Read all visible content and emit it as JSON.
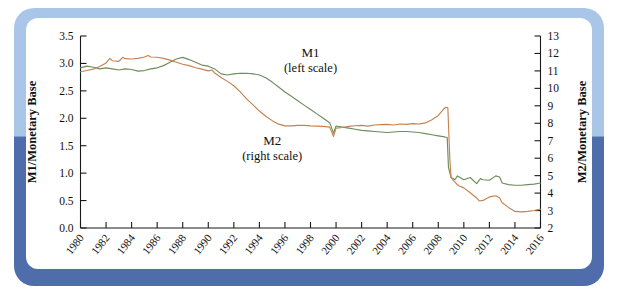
{
  "figure": {
    "frame_top_color": "#a9c6e8",
    "frame_bottom_color": "#4f6cab",
    "background_color": "#ffffff"
  },
  "chart_data": {
    "type": "line",
    "title": "",
    "xlabel": "",
    "ylabel": "M1/Monetary Base",
    "y2label": "M2/Monetary Base",
    "grid": false,
    "legend": "in-plot annotations",
    "xlim": [
      1980,
      2016
    ],
    "ylim": [
      0.0,
      3.5
    ],
    "y2lim": [
      2,
      13
    ],
    "xticks": [
      1980,
      1982,
      1984,
      1986,
      1988,
      1990,
      1992,
      1994,
      1996,
      1998,
      2000,
      2002,
      2004,
      2006,
      2008,
      2010,
      2012,
      2014,
      2016
    ],
    "xtick_labels": [
      "1980",
      "1982",
      "1984",
      "1986",
      "1988",
      "1990",
      "1992",
      "1994",
      "1996",
      "1998",
      "2000",
      "2002",
      "2004",
      "2006",
      "2008",
      "2010",
      "2012",
      "2014",
      "2016"
    ],
    "yticks": [
      0.0,
      0.5,
      1.0,
      1.5,
      2.0,
      2.5,
      3.0,
      3.5
    ],
    "ytick_labels": [
      "0.0",
      "0.5",
      "1.0",
      "1.5",
      "2.0",
      "2.5",
      "3.0",
      "3.5"
    ],
    "y2ticks": [
      2,
      3,
      4,
      5,
      6,
      7,
      8,
      9,
      10,
      11,
      12,
      13
    ],
    "y2tick_labels": [
      "2",
      "3",
      "4",
      "5",
      "6",
      "7",
      "8",
      "9",
      "10",
      "11",
      "12",
      "13"
    ],
    "annotations": [
      {
        "name": "m1-label",
        "line1": "M1",
        "line2": "(left scale)",
        "x": 1998.0,
        "y": 3.12
      },
      {
        "name": "m2-label",
        "line1": "M2",
        "line2": "(right scale)",
        "x": 1995.0,
        "y": 1.52
      }
    ],
    "series": [
      {
        "name": "M1",
        "axis": "left",
        "color": "#6e8d5d",
        "x": [
          1980.0,
          1980.5,
          1981.0,
          1981.5,
          1982.0,
          1982.5,
          1983.0,
          1983.5,
          1984.0,
          1984.5,
          1985.0,
          1985.5,
          1986.0,
          1986.5,
          1987.0,
          1987.5,
          1988.0,
          1988.5,
          1989.0,
          1989.5,
          1990.0,
          1990.5,
          1991.0,
          1991.5,
          1992.0,
          1992.5,
          1993.0,
          1993.5,
          1994.0,
          1994.5,
          1995.0,
          1995.5,
          1996.0,
          1996.5,
          1997.0,
          1997.5,
          1998.0,
          1998.5,
          1999.0,
          1999.5,
          1999.8,
          2000.0,
          2000.5,
          2001.0,
          2001.5,
          2002.0,
          2002.5,
          2003.0,
          2003.5,
          2004.0,
          2004.5,
          2005.0,
          2005.5,
          2006.0,
          2006.5,
          2007.0,
          2007.5,
          2008.0,
          2008.5,
          2008.7,
          2008.8,
          2009.0,
          2009.3,
          2009.5,
          2010.0,
          2010.5,
          2011.0,
          2011.3,
          2011.5,
          2012.0,
          2012.5,
          2012.8,
          2013.0,
          2013.5,
          2014.0,
          2014.5,
          2015.0,
          2015.5,
          2016.0
        ],
        "y": [
          2.92,
          2.95,
          2.93,
          2.9,
          2.92,
          2.9,
          2.88,
          2.9,
          2.89,
          2.86,
          2.87,
          2.9,
          2.92,
          2.96,
          3.02,
          3.08,
          3.11,
          3.07,
          3.02,
          2.97,
          2.95,
          2.9,
          2.81,
          2.79,
          2.81,
          2.82,
          2.82,
          2.81,
          2.79,
          2.74,
          2.66,
          2.57,
          2.48,
          2.4,
          2.32,
          2.24,
          2.16,
          2.08,
          2.0,
          1.92,
          1.73,
          1.86,
          1.84,
          1.82,
          1.8,
          1.78,
          1.77,
          1.76,
          1.75,
          1.74,
          1.75,
          1.76,
          1.76,
          1.75,
          1.74,
          1.72,
          1.7,
          1.68,
          1.66,
          1.65,
          1.1,
          0.92,
          0.88,
          0.95,
          0.88,
          0.92,
          0.81,
          0.9,
          0.88,
          0.87,
          0.95,
          0.93,
          0.82,
          0.79,
          0.78,
          0.78,
          0.79,
          0.8,
          0.82
        ]
      },
      {
        "name": "M2",
        "axis": "right",
        "color": "#c5824f",
        "x": [
          1980.0,
          1980.5,
          1981.0,
          1981.5,
          1982.0,
          1982.3,
          1982.5,
          1983.0,
          1983.3,
          1983.5,
          1984.0,
          1984.5,
          1985.0,
          1985.3,
          1985.5,
          1986.0,
          1986.5,
          1987.0,
          1987.5,
          1988.0,
          1988.5,
          1989.0,
          1989.5,
          1990.0,
          1990.3,
          1990.5,
          1991.0,
          1991.5,
          1992.0,
          1992.5,
          1993.0,
          1993.5,
          1994.0,
          1994.5,
          1995.0,
          1995.5,
          1996.0,
          1996.5,
          1997.0,
          1997.5,
          1998.0,
          1998.5,
          1999.0,
          1999.5,
          1999.8,
          2000.0,
          2000.5,
          2001.0,
          2001.5,
          2002.0,
          2002.5,
          2003.0,
          2003.5,
          2004.0,
          2004.5,
          2005.0,
          2005.5,
          2006.0,
          2006.5,
          2007.0,
          2007.5,
          2008.0,
          2008.4,
          2008.6,
          2008.75,
          2008.9,
          2009.0,
          2009.2,
          2009.4,
          2009.6,
          2010.0,
          2010.5,
          2011.0,
          2011.2,
          2011.5,
          2012.0,
          2012.5,
          2012.8,
          2013.0,
          2013.5,
          2014.0,
          2014.5,
          2015.0,
          2015.5,
          2016.0
        ],
        "y": [
          10.95,
          11.02,
          11.1,
          11.25,
          11.45,
          11.72,
          11.58,
          11.55,
          11.78,
          11.7,
          11.68,
          11.72,
          11.8,
          11.88,
          11.8,
          11.78,
          11.72,
          11.62,
          11.5,
          11.38,
          11.3,
          11.18,
          11.1,
          11.0,
          11.05,
          10.88,
          10.62,
          10.4,
          10.15,
          9.8,
          9.4,
          9.05,
          8.7,
          8.4,
          8.15,
          7.95,
          7.85,
          7.85,
          7.88,
          7.88,
          7.85,
          7.84,
          7.82,
          7.78,
          7.25,
          7.72,
          7.76,
          7.82,
          7.86,
          7.88,
          7.84,
          7.9,
          7.92,
          7.94,
          7.9,
          7.96,
          7.94,
          7.98,
          7.96,
          8.02,
          8.2,
          8.45,
          8.8,
          8.92,
          8.88,
          6.0,
          4.9,
          4.72,
          4.55,
          4.42,
          4.3,
          4.02,
          3.72,
          3.55,
          3.58,
          3.78,
          3.85,
          3.72,
          3.45,
          3.18,
          2.95,
          2.92,
          2.95,
          3.0,
          3.08
        ]
      }
    ]
  }
}
